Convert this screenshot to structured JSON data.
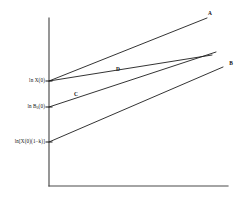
{
  "figure": {
    "background_color": "#ffffff",
    "line_color": "#1d1d1d",
    "axis_color": "#4a4a4a"
  },
  "axes": {
    "y_axis_name": "y-axis",
    "x_axis_name": "x-axis",
    "y_axis_x_px": 49,
    "y_axis_top_px": 18,
    "y_axis_bottom_px": 186,
    "x_axis_y_px": 186,
    "x_axis_left_px": 49,
    "x_axis_right_px": 228
  },
  "y_ticks": [
    {
      "label_html": "ln X(0)",
      "label": "ln X(0)",
      "y_px": 81
    },
    {
      "label_html": "ln B<sub>0</sub>(0)",
      "label": "ln B0(0)",
      "y_px": 107
    },
    {
      "label_html": "ln[X(0)(1−k)]",
      "label": "ln[X(0)(1-k)]",
      "y_px": 142
    }
  ],
  "curve_labels": [
    {
      "text": "A",
      "x_px": 210,
      "y_px": 14
    },
    {
      "text": "B",
      "x_px": 231,
      "y_px": 64
    },
    {
      "text": "C",
      "x_px": 76,
      "y_px": 95
    },
    {
      "text": "D",
      "x_px": 118,
      "y_px": 70
    }
  ],
  "chart_data": {
    "type": "line",
    "title": "",
    "xlabel": "",
    "ylabel": "",
    "grid": false,
    "legend": "inline-end-labels",
    "x_range_px": [
      49,
      228
    ],
    "y_range_px": [
      186,
      18
    ],
    "series": [
      {
        "name": "A",
        "description": "steepest line from ln X(0) rising to upper right",
        "points_px": [
          [
            49,
            81
          ],
          [
            207,
            18
          ]
        ]
      },
      {
        "name": "D",
        "description": "shallow line from ln X(0) rising to meet the bundle at right",
        "points_px": [
          [
            49,
            81
          ],
          [
            212,
            55
          ]
        ]
      },
      {
        "name": "C",
        "description": "line from ln B0(0) crossing D near the right edge",
        "points_px": [
          [
            49,
            107
          ],
          [
            216,
            52
          ]
        ]
      },
      {
        "name": "B",
        "description": "lowest line from ln[X(0)(1-k)] rising to the right edge",
        "points_px": [
          [
            49,
            142
          ],
          [
            223,
            67
          ]
        ]
      }
    ]
  }
}
